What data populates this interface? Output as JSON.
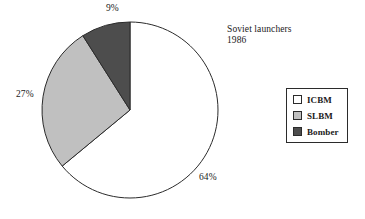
{
  "chart_data": {
    "type": "pie",
    "title": "Soviet launchers",
    "subtitle": "1986",
    "xlabel": "",
    "ylabel": "",
    "legend_position": "right",
    "grid": false,
    "units": "percent",
    "start_angle_deg": 90,
    "direction": "clockwise",
    "categories": [
      "ICBM",
      "SLBM",
      "Bomber"
    ],
    "values": [
      64,
      27,
      9
    ],
    "data_labels": [
      "64%",
      "27%",
      "9%"
    ],
    "colors": [
      "#ffffff",
      "#c0c0c0",
      "#4d4d4d"
    ],
    "slices": [
      {
        "label": "ICBM",
        "value": 64,
        "data_label": "64%",
        "color": "#ffffff"
      },
      {
        "label": "SLBM",
        "value": 27,
        "data_label": "27%",
        "color": "#c0c0c0"
      },
      {
        "label": "Bomber",
        "value": 9,
        "data_label": "9%",
        "color": "#4d4d4d"
      }
    ]
  },
  "title_block": {
    "line1": "Soviet launchers",
    "line2": "1986"
  },
  "legend": {
    "items": [
      {
        "label": "ICBM",
        "color": "#ffffff"
      },
      {
        "label": "SLBM",
        "color": "#c0c0c0"
      },
      {
        "label": "Bomber",
        "color": "#4d4d4d"
      }
    ]
  },
  "labels": {
    "bomber_pct": "9%",
    "slbm_pct": "27%",
    "icbm_pct": "64%"
  },
  "style": {
    "outline": "#2b2b2b",
    "background": "#ffffff"
  }
}
